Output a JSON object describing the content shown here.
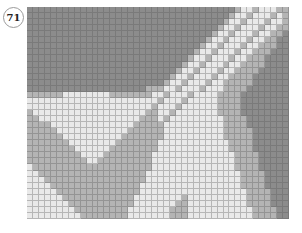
{
  "badge": {
    "number": "71"
  },
  "mosaic": {
    "columns": 44,
    "rows_count": 35,
    "legend": {
      "D": "#8c8c8c",
      "M": "#b4b4b4",
      "L": "#e9e9e9",
      "W": "#f6f6f6"
    },
    "rows": [
      "DDDDDDDDDDDDDDDDDDDDDDDDDDDDDDDDDDDMLLMLLLMM",
      "DDDDDDDDDDDDDDDDDDDDDDDDDDDDDDDDDDMLLMLLLMLM",
      "DDDDDDDDDDDDDDDDDDDDDDDDDDDDDDDDDMLLMLLLMLLM",
      "DDDDDDDDDDDDDDDDDDDDDDDDDDDDDDDDMLLMLLLMLLMM",
      "DDDDDDDDDDDDDDDDDDDDDDDDDDDDDDDMLLMLLLMLLMMD",
      "DDDDDDDDDDDDDDDDDDDDDDDDDDDDDDMLLMLLLMLLMMDD",
      "DDDDDDDDDDDDDDDDDDDDDDDDDDDDDMLLMLLLMLLMMMDD",
      "DDDDDDDDDDDDDDDDDDDDDDDDDDDDMLLMLLLMLLMMMDDD",
      "DDDDDDDDDDDDDDDDDDDDDDDDDDDMLLMLLLMLLMMMDDDD",
      "DDDDDDDDDDDDDDDDDDDDDDDDDDMLLMLLLMLLMMMMDDDD",
      "DDDDDDDDDDDDDDDDDDDDDDDDDMLLMLLLMLLMMMMDDDDD",
      "DDDDDDDDDDDDDDDDDDDDDDDDMLLMLLLMLLMMMMDDDDDD",
      "DDDDDDDDDDDDDDDDDDDDDDDMLLMLLLMLLMMMMMDDDDDD",
      "DDDDDDDDDDDDDDDDDDDDMMMLLMLLLMLLLMMMMDDDDDDD",
      "MMMMMMLLLLLLLLMMMMMMMLLMLLLMLLLLMMMMDDDDDDDD",
      "LLLLLLLLLLLLLLLLLLLLLLMLLLMLLLLLMMMMDDDDDDDD",
      "LLLLLLLLLLLLLLLLLLLLLMLLLMLLLLLLMMMMDDDDDDDD",
      "MLLLLLLLLLLLLLLLLLLLMMLLMLLLLLLLMMMMDDDDDDDD",
      "MMLLLLLLLLLLLLLLLLLMMMLMLLLLLLLLLMMMMDDDDDDD",
      "MMMMLLLLLLLLLLLLLLMMMMMLLLLLLLLLLMMMMDDDDDDD",
      "MMMMMLLLLLLLLLLLLMMMMMMLLLLLLLLLLMMMMMDDDDDD",
      "MMMMMMLLLLLLLLLLMMMMMMMLLLLLLLLLLMMMMMDDDDDD",
      "MMMMMMMLLLLLLLLMMMMMMMLLLLLLLLLLLLMMMMDDDDDD",
      "MMMMMMMMLLLLLLMMMMMMMMLLLLLLLLLLLLMMMMDDDDDD",
      "MMMMMMMMMLLLLMMMMMMMMLLLLLLLLLLLLLLMMMMDDDDD",
      "MMMMMMMMMMLLMMMMMMMMMLLLLLLLLLLLLLLMMMMDDDDD",
      "LMMMMMMMMMMMMMMMMMMMMLLLLLLLLLLLLLLMMMMDDDDD",
      "LLMMMMMMMMMMMMMMMMMMLLLLLLLLLLLLLLLLMMMMDDDD",
      "LLLMMMMMMMMMMMMMMMMMLLLLLLLLLLLLLLLLMMMMDDDD",
      "LLLLMMMMMMMMMMMMMMMLLLLLLLLLLLLLLLLLMMMMDDDD",
      "LLLLLMMMMMMMMMMMMMMLLLLLLLLLLLLLLLLLLMMMMDDD",
      "LLLLLLMMMMMMMMMMMMLLLLLLLLMLLLLLLLLLLMMMMDDD",
      "LLLLLLLMMMMMMMMMMMLLLLLLLMMLLLLLLLLLLMMMMDDD",
      "LLLLLLLLMMMMMMMMMLLLLLLLMMMLLLLLLLLLLLMMMMDD",
      "LLLLLLLLLMMMMMMMMLLLLLLLMMMLLLLLLLLLLLMMMMDD"
    ]
  }
}
